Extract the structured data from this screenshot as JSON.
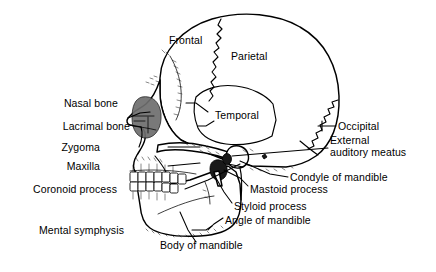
{
  "figure": {
    "type": "anatomical-line-diagram",
    "background_color": "#ffffff",
    "line_color": "#000000"
  },
  "labels": {
    "left": [
      {
        "id": "nasal-bone",
        "text": "Nasal bone",
        "x": 118,
        "y": 103,
        "leader": true
      },
      {
        "id": "lacrimal-bone",
        "text": "Lacrimal bone",
        "x": 118,
        "y": 126,
        "leader": true
      },
      {
        "id": "zygoma",
        "text": "Zygoma",
        "x": 118,
        "y": 147,
        "leader": true
      },
      {
        "id": "maxilla",
        "text": "Maxilla",
        "x": 118,
        "y": 166,
        "leader": true
      },
      {
        "id": "coronoid-process",
        "text": "Coronoid process",
        "x": 118,
        "y": 189,
        "leader": true
      },
      {
        "id": "mental-symphysis",
        "text": "Mental symphysis",
        "x": 128,
        "y": 230,
        "leader": true
      }
    ],
    "right": [
      {
        "id": "occipital",
        "text": "Occipital",
        "x": 338,
        "y": 125,
        "leader": true
      },
      {
        "id": "external-auditory-meatus",
        "text": "External\nauditory meatus",
        "x": 330,
        "y": 140,
        "leader": true
      },
      {
        "id": "condyle-of-mandible",
        "text": "Condyle of mandible",
        "x": 290,
        "y": 176,
        "leader": true
      },
      {
        "id": "mastoid-process",
        "text": "Mastoid process",
        "x": 250,
        "y": 188,
        "leader": true
      },
      {
        "id": "styloid-process",
        "text": "Styloid process",
        "x": 234,
        "y": 206,
        "leader": true
      },
      {
        "id": "angle-of-mandible",
        "text": "Angle of mandible",
        "x": 225,
        "y": 220,
        "leader": true
      }
    ],
    "inner": [
      {
        "id": "frontal",
        "text": "Frontal",
        "x": 170,
        "y": 38
      },
      {
        "id": "parietal",
        "text": "Parietal",
        "x": 232,
        "y": 52
      },
      {
        "id": "temporal",
        "text": "Temporal",
        "x": 216,
        "y": 112
      }
    ],
    "bottom": [
      {
        "id": "body-of-mandible",
        "text": "Body of mandible",
        "x": 160,
        "y": 244,
        "leader": true
      }
    ]
  },
  "label_texts": {
    "nasal_bone": "Nasal bone",
    "lacrimal_bone": "Lacrimal bone",
    "zygoma": "Zygoma",
    "maxilla": "Maxilla",
    "coronoid_process": "Coronoid process",
    "mental_symphysis": "Mental symphysis",
    "frontal": "Frontal",
    "parietal": "Parietal",
    "temporal": "Temporal",
    "occipital": "Occipital",
    "external_auditory_meatus_line1": "External",
    "external_auditory_meatus_line2": "auditory meatus",
    "condyle_of_mandible": "Condyle of mandible",
    "mastoid_process": "Mastoid process",
    "styloid_process": "Styloid process",
    "angle_of_mandible": "Angle of mandible",
    "body_of_mandible": "Body of mandible"
  }
}
